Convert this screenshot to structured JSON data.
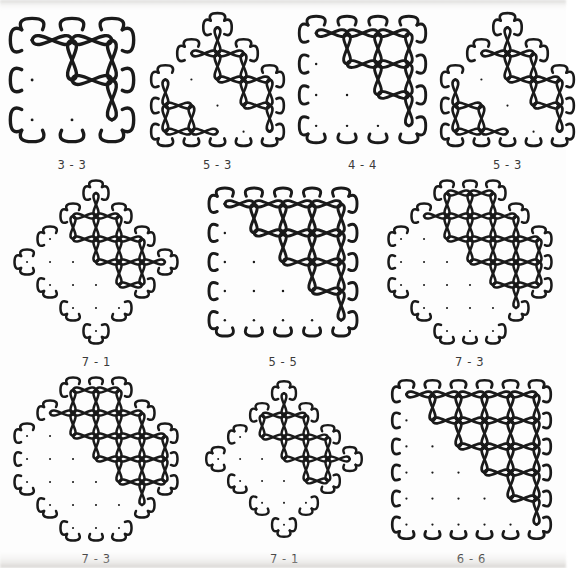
{
  "page": {
    "background_color": "#fdfdfd",
    "stroke_color": "#1a1a1a",
    "dot_color": "#1a1a1a",
    "label_color": "#3a3a3a"
  },
  "grid": {
    "rows": [
      {
        "cells": [
          {
            "label": "3 - 3",
            "name": "kolam-3-3",
            "shape": "square",
            "row_counts": [
              3,
              3,
              3
            ],
            "cell_px": 40,
            "stroke_px": 3.4
          },
          {
            "label": "5 - 3",
            "name": "kolam-5-3-a",
            "shape": "triangle",
            "row_counts": [
              1,
              3,
              5,
              5,
              5
            ],
            "cell_px": 26,
            "stroke_px": 2.6
          },
          {
            "label": "4 - 4",
            "name": "kolam-4-4",
            "shape": "square",
            "row_counts": [
              4,
              4,
              4,
              4
            ],
            "cell_px": 31,
            "stroke_px": 2.9
          },
          {
            "label": "5 - 3",
            "name": "kolam-5-3-b",
            "shape": "triangle",
            "row_counts": [
              1,
              3,
              5,
              5,
              5
            ],
            "cell_px": 26,
            "stroke_px": 2.6
          }
        ]
      },
      {
        "cells": [
          {
            "label": "7 - 1",
            "name": "kolam-7-1-a",
            "shape": "diamond",
            "row_counts": [
              1,
              3,
              5,
              7,
              5,
              3,
              1
            ],
            "cell_px": 23,
            "stroke_px": 2.5
          },
          {
            "label": "5 - 5",
            "name": "kolam-5-5",
            "shape": "square",
            "row_counts": [
              5,
              5,
              5,
              5,
              5
            ],
            "cell_px": 29,
            "stroke_px": 2.9
          },
          {
            "label": "7 - 3",
            "name": "kolam-7-3-a",
            "shape": "hexagon",
            "row_counts": [
              3,
              5,
              7,
              7,
              7,
              5,
              3
            ],
            "cell_px": 23,
            "stroke_px": 2.5
          }
        ]
      },
      {
        "cells": [
          {
            "label": "7 - 3",
            "name": "kolam-7-3-b",
            "shape": "hexagon",
            "row_counts": [
              3,
              5,
              7,
              7,
              7,
              5,
              3
            ],
            "cell_px": 23,
            "stroke_px": 2.5
          },
          {
            "label": "7 - 1",
            "name": "kolam-7-1-b",
            "shape": "diamond",
            "row_counts": [
              1,
              3,
              5,
              7,
              5,
              3,
              1
            ],
            "cell_px": 22,
            "stroke_px": 2.4
          },
          {
            "label": "6 - 6",
            "name": "kolam-6-6",
            "shape": "square",
            "row_counts": [
              6,
              6,
              6,
              6,
              6,
              6
            ],
            "cell_px": 26,
            "stroke_px": 2.7
          }
        ]
      }
    ]
  }
}
